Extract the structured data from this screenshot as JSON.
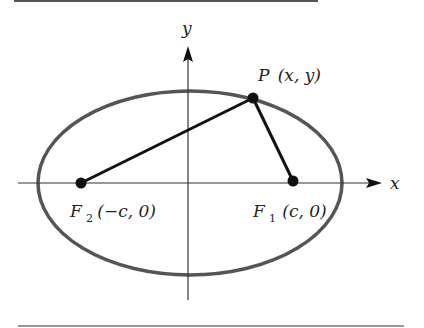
{
  "diagram": {
    "axes": {
      "x_label": "x",
      "y_label": "y"
    },
    "points": {
      "P": {
        "name": "P",
        "coords": "(x, y)"
      },
      "F1": {
        "name": "F",
        "sub": "1",
        "coords": "(c, 0)"
      },
      "F2": {
        "name": "F",
        "sub": "2",
        "coords": "(−c, 0)"
      }
    },
    "colors": {
      "ellipse": "#555555",
      "axis": "#333333",
      "segment": "#111111",
      "rule": "#555555"
    }
  }
}
